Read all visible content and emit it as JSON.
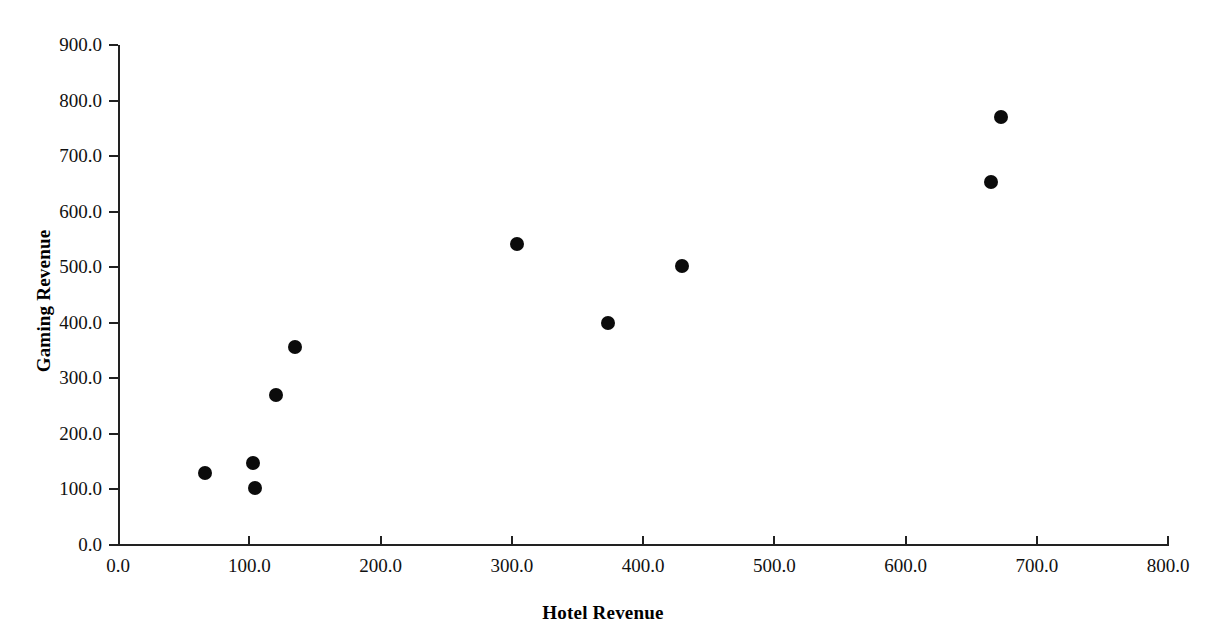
{
  "chart_data": {
    "type": "scatter",
    "title": "",
    "xlabel": "Hotel Revenue",
    "ylabel": "Gaming Revenue",
    "xlim": [
      0,
      800
    ],
    "ylim": [
      0,
      900
    ],
    "grid": false,
    "legend": "none",
    "marker": {
      "shape": "circle",
      "color": "#0b0b0b",
      "size": 14
    },
    "x_ticks": [
      0,
      100,
      200,
      300,
      400,
      500,
      600,
      700,
      800
    ],
    "y_ticks": [
      0,
      100,
      200,
      300,
      400,
      500,
      600,
      700,
      800,
      900
    ],
    "x_tick_labels": [
      "0.0",
      "100.0",
      "200.0",
      "300.0",
      "400.0",
      "500.0",
      "600.0",
      "700.0",
      "800.0"
    ],
    "y_tick_labels": [
      "0.0",
      "100.0",
      "200.0",
      "300.0",
      "400.0",
      "500.0",
      "600.0",
      "700.0",
      "800.0",
      "900.0"
    ],
    "points": [
      {
        "x": 66,
        "y": 130
      },
      {
        "x": 103,
        "y": 147
      },
      {
        "x": 104,
        "y": 103
      },
      {
        "x": 120,
        "y": 270
      },
      {
        "x": 135,
        "y": 356
      },
      {
        "x": 304,
        "y": 541
      },
      {
        "x": 373,
        "y": 399
      },
      {
        "x": 430,
        "y": 502
      },
      {
        "x": 665,
        "y": 653
      },
      {
        "x": 673,
        "y": 770
      }
    ]
  }
}
